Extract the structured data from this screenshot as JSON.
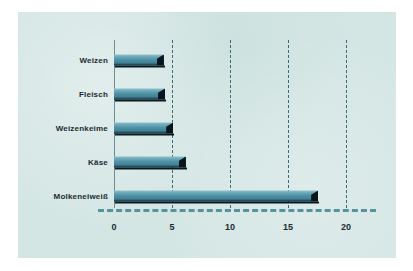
{
  "chart_data": {
    "type": "bar",
    "orientation": "horizontal",
    "title": "",
    "xlabel": "",
    "ylabel": "",
    "categories": [
      "Weizen",
      "Fleisch",
      "Weizenkeime",
      "Käse",
      "Molkeneiweiß"
    ],
    "values": [
      4.3,
      4.4,
      5.1,
      6.2,
      17.6
    ],
    "xlim": [
      0,
      22
    ],
    "xticks": [
      0,
      5,
      10,
      15,
      20
    ],
    "xtick_labels": [
      "0",
      "5",
      "10",
      "15",
      "20"
    ],
    "grid": "vertical-dashed",
    "legend": "none",
    "series": [
      {
        "name": "",
        "values": [
          4.3,
          4.4,
          5.1,
          6.2,
          17.6
        ]
      }
    ]
  },
  "style": {
    "panel_background": "#d4e6e4",
    "page_background": "#ffffff",
    "bar_fill_light": "#8fc0cb",
    "bar_fill_mid": "#4e8fa3",
    "bar_fill_dark": "#0b1f27",
    "bar_shadow": "#081a21",
    "gridline_color": "#3c6a74",
    "axis_color": "#6d8e93",
    "baseline_color": "#55939e",
    "text_color": "#1c2b30"
  }
}
